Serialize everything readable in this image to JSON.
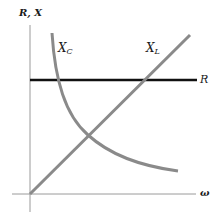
{
  "diagram": {
    "y_axis_label": "R, X",
    "x_axis_label": "ω",
    "curves": [
      {
        "id": "R",
        "label": "R",
        "shape": "horizontal line",
        "color": "#111111"
      },
      {
        "id": "XL",
        "label_main": "X",
        "label_sub": "L",
        "shape": "straight line increasing with ω",
        "color": "#888888"
      },
      {
        "id": "XC",
        "label_main": "X",
        "label_sub": "C",
        "shape": "hyperbola decreasing with ω",
        "color": "#888888"
      }
    ]
  },
  "colors": {
    "axis": "#999999",
    "resistance_line": "#111111",
    "reactance_curves": "#8a8a8a",
    "background": "#ffffff"
  }
}
